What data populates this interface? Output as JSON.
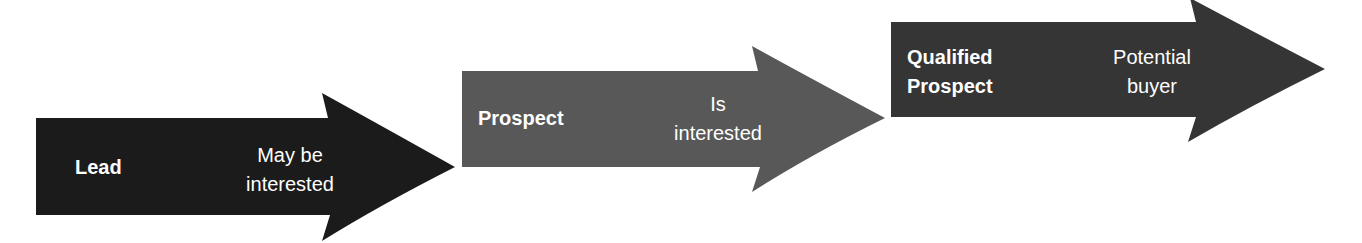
{
  "diagram": {
    "type": "sales-funnel-progression",
    "stages": [
      {
        "name": "Lead",
        "description": "May be interested",
        "color": "#1b1b1b",
        "desc_lines": [
          "May be",
          "interested"
        ],
        "name_lines": [
          "Lead"
        ]
      },
      {
        "name": "Prospect",
        "description": "Is interested",
        "color": "#585858",
        "desc_lines": [
          "Is",
          "interested"
        ],
        "name_lines": [
          "Prospect"
        ]
      },
      {
        "name": "Qualified Prospect",
        "description": "Potential buyer",
        "color": "#353535",
        "desc_lines": [
          "Potential",
          "buyer"
        ],
        "name_lines": [
          "Qualified",
          "Prospect"
        ]
      }
    ]
  }
}
